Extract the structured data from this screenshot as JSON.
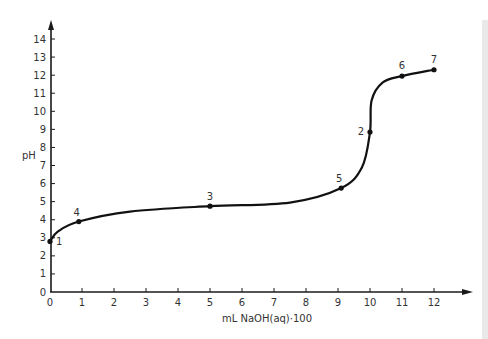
{
  "chart_data": {
    "type": "line",
    "title": "",
    "xlabel": "mL NaOH(aq)·100",
    "ylabel": "pH",
    "xlim": [
      0,
      12
    ],
    "ylim": [
      0,
      14
    ],
    "x_ticks": [
      0,
      1,
      2,
      3,
      4,
      5,
      6,
      7,
      8,
      9,
      10,
      11,
      12
    ],
    "y_ticks": [
      0,
      1,
      2,
      3,
      4,
      5,
      6,
      7,
      8,
      9,
      10,
      11,
      12,
      13,
      14
    ],
    "grid": false,
    "legend": null,
    "series": [
      {
        "name": "titration curve",
        "color": "#111111",
        "points": [
          {
            "label": "1",
            "x": 0.0,
            "y": 2.8
          },
          {
            "label": "4",
            "x": 0.9,
            "y": 3.9
          },
          {
            "label": "3",
            "x": 5.0,
            "y": 4.75
          },
          {
            "label": "5",
            "x": 9.1,
            "y": 5.75
          },
          {
            "label": "2",
            "x": 10.0,
            "y": 8.85
          },
          {
            "label": "6",
            "x": 11.0,
            "y": 11.95
          },
          {
            "label": "7",
            "x": 12.0,
            "y": 12.3
          }
        ]
      }
    ],
    "annotations": [
      "1",
      "2",
      "3",
      "4",
      "5",
      "6",
      "7"
    ]
  },
  "colors": {
    "line": "#111111",
    "axis": "#1a1a1a",
    "text": "#333333",
    "side_strip": "#e9e9e9"
  }
}
